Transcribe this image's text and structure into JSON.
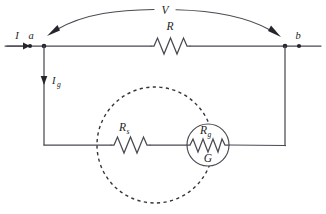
{
  "diagram": {
    "labels": {
      "voltage": "V",
      "resistor_main": "R",
      "current_in": "I",
      "node_left": "a",
      "node_right": "b",
      "current_galvanometer_base": "I",
      "current_galvanometer_sub": "g",
      "shunt_base": "R",
      "shunt_sub": "s",
      "galvanometer_resistance_base": "R",
      "galvanometer_resistance_sub": "g",
      "galvanometer": "G"
    },
    "colors": {
      "wire": "#4a4a52",
      "dashed": "#34343c",
      "text": "#1d1d22",
      "background": "#ffffff"
    },
    "geometry": {
      "top_wire_y": 46,
      "bottom_wire_y": 145,
      "node_a_x": 44,
      "node_b_x": 285,
      "dashed_circle_cx": 155,
      "dashed_circle_cy": 145,
      "dashed_circle_r": 58,
      "galvanometer_cx": 208,
      "galvanometer_cy": 145,
      "galvanometer_r": 21
    }
  }
}
